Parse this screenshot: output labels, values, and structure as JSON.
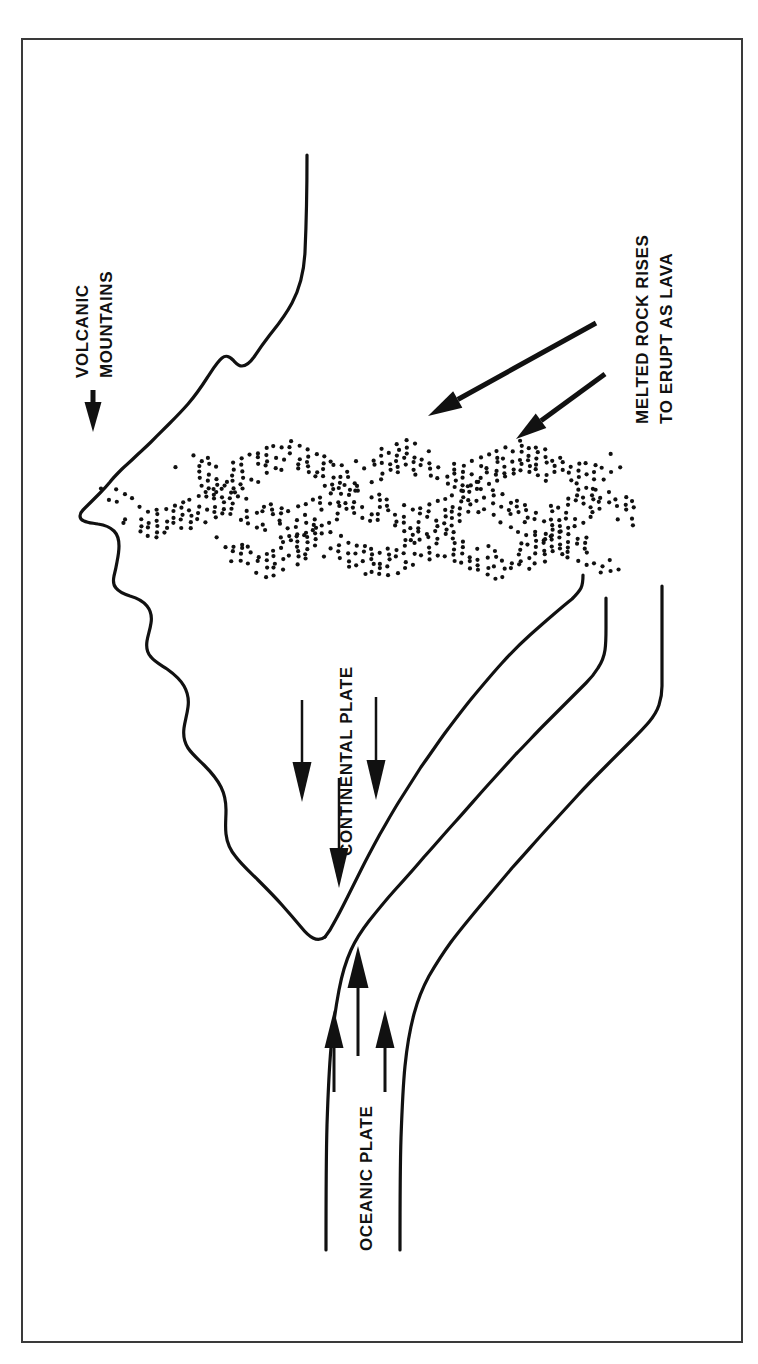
{
  "figure": {
    "background_color": "#ffffff",
    "ink_color": "#111111",
    "border": {
      "present": true,
      "color": "#3a3a3a",
      "x": 22,
      "y": 39,
      "width": 720,
      "height": 1303,
      "stroke_width": 2
    }
  },
  "labels": {
    "volcanic_mountains": {
      "line1": "VOLCANIC",
      "line2": "MOUNTAINS",
      "rotation_deg": -90,
      "font_size": 17
    },
    "melted_rock": {
      "line1": "MELTED ROCK RISES",
      "line2": "TO ERUPT AS LAVA",
      "rotation_deg": -90,
      "font_size": 17
    },
    "continental_plate": {
      "text": "CONTINENTAL PLATE",
      "rotation_deg": -90,
      "font_size": 17
    },
    "oceanic_plate": {
      "text": "OCEANIC PLATE",
      "rotation_deg": -90,
      "font_size": 17
    }
  },
  "arrows": {
    "pointer_to_mountains": {
      "name": "volcanic-mountains-pointer",
      "direction": "down",
      "x": 93,
      "y_start": 390,
      "y_end": 432,
      "head_width": 17,
      "head_length": 30,
      "shaft_width": 5
    },
    "magma_arrows": [
      {
        "name": "magma-arrow-long",
        "direction": "down-left",
        "x1": 596,
        "y1": 323,
        "x2": 428,
        "y2": 416,
        "shaft_width": 5,
        "head_width": 19,
        "head_length": 34
      },
      {
        "name": "magma-arrow-short",
        "direction": "down-left",
        "x1": 605,
        "y1": 374,
        "x2": 516,
        "y2": 439,
        "shaft_width": 5,
        "head_width": 18,
        "head_length": 31
      }
    ],
    "downward_arrows": [
      {
        "name": "continental-down-arrow-left",
        "x": 302,
        "y_start": 700,
        "y_end": 802,
        "shaft_width": 2.5,
        "head_width": 19,
        "head_length": 40
      },
      {
        "name": "continental-down-arrow-right",
        "x": 376,
        "y_start": 697,
        "y_end": 800,
        "shaft_width": 2.5,
        "head_width": 19,
        "head_length": 40
      },
      {
        "name": "continental-down-arrow-center",
        "x": 339,
        "y_start": 778,
        "y_end": 888,
        "shaft_width": 2.5,
        "head_width": 19,
        "head_length": 40
      }
    ],
    "upward_arrows": [
      {
        "name": "oceanic-up-arrow-center",
        "x": 358,
        "y_start": 1056,
        "y_end": 946,
        "shaft_width": 3,
        "head_width": 21,
        "head_length": 42
      },
      {
        "name": "oceanic-up-arrow-left",
        "x": 334,
        "y_start": 1092,
        "y_end": 1010,
        "shaft_width": 3,
        "head_width": 19,
        "head_length": 38
      },
      {
        "name": "oceanic-up-arrow-right",
        "x": 385,
        "y_start": 1092,
        "y_end": 1010,
        "shaft_width": 3,
        "head_width": 19,
        "head_length": 38
      }
    ]
  },
  "geology": {
    "mountain_profile_note": "Jagged volcanic mountain range profile rising to a peak at upper centre-left",
    "continental_plate_note": "Wedge-shaped continental plate descending to a trough at centre",
    "oceanic_slab_note": "Two parallel curves forming the subducting oceanic slab",
    "magma_bands": {
      "count": 3,
      "pattern": "stippled wavy chevron bands",
      "dot_radius": 2.1,
      "dot_color": "#111111"
    }
  }
}
